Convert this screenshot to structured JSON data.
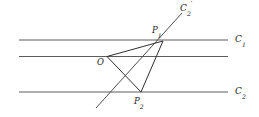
{
  "figure": {
    "type": "geometric-diagram",
    "width": 259,
    "height": 117,
    "background_color": "#ffffff",
    "stroke_color": "#3a3a3a",
    "label_color": "#1a1a1a",
    "labels": {
      "c1": "C",
      "c1_sub": "1",
      "c2": "C",
      "c2_sub": "2",
      "c2prime": "C",
      "c2prime_sub": "2",
      "c2prime_sup": "′",
      "o": "O",
      "p1": "P",
      "p1_sub": "1",
      "p2": "P",
      "p2_sub": "2"
    },
    "parallel_lines": [
      {
        "name": "C1",
        "x1": 19,
        "y1": 40,
        "x2": 228,
        "y2": 40,
        "label": "C1"
      },
      {
        "name": "middle",
        "x1": 19,
        "y1": 56.5,
        "x2": 228,
        "y2": 56.5,
        "label": ""
      },
      {
        "name": "C2",
        "x1": 19,
        "y1": 92,
        "x2": 228,
        "y2": 92,
        "label": "C2"
      }
    ],
    "points": [
      {
        "name": "O",
        "x": 107,
        "y": 56.5
      },
      {
        "name": "P1",
        "x": 163,
        "y": 41
      },
      {
        "name": "P2",
        "x": 141,
        "y": 92
      }
    ],
    "segments": [
      {
        "name": "O-P1",
        "x1": 107,
        "y1": 56.5,
        "x2": 163,
        "y2": 41
      },
      {
        "name": "O-P2",
        "x1": 107,
        "y1": 56.5,
        "x2": 141,
        "y2": 92
      },
      {
        "name": "P1-P2",
        "x1": 163,
        "y1": 41,
        "x2": 141,
        "y2": 92
      }
    ],
    "rays": [
      {
        "name": "C2-prime",
        "x1": 96,
        "y1": 108,
        "x2": 182,
        "y2": 13
      }
    ],
    "label_positions": {
      "c1": {
        "x": 235,
        "y": 35
      },
      "c2": {
        "x": 235,
        "y": 87
      },
      "c2prime": {
        "x": 180,
        "y": 4
      },
      "o": {
        "x": 97,
        "y": 58
      },
      "p1": {
        "x": 152,
        "y": 26
      },
      "p2": {
        "x": 134,
        "y": 97
      }
    }
  }
}
